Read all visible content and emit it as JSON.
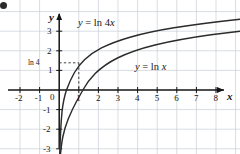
{
  "chart_data": {
    "type": "line",
    "title": "",
    "subtitle": "",
    "xlabel": "x",
    "ylabel": "y",
    "xlim": [
      -2.9,
      9.2
    ],
    "ylim": [
      -3.4,
      3.9
    ],
    "grid": true,
    "grid_color": "#c9cfd6",
    "axis_color": "#1a1a1a",
    "curve_color": "#2b2b2b",
    "background": "#ffffff",
    "legend": "inline-labels",
    "xticks": [
      -2,
      -1,
      0,
      1,
      2,
      3,
      4,
      5,
      6,
      7,
      8
    ],
    "xtick_labels": [
      "-2",
      "-1",
      "0",
      "1",
      "2",
      "3",
      "4",
      "5",
      "6",
      "7",
      "8"
    ],
    "yticks": [
      -3,
      -2,
      -1,
      1,
      2,
      3
    ],
    "ytick_labels": [
      "-3",
      "-2",
      "-1",
      "1",
      "2",
      "3"
    ],
    "annotations": [
      {
        "name": "ln4-y-intercept-label",
        "text": "ln 4",
        "x": -0.55,
        "y": 1.386,
        "note": "value of ln 4x at x = 1"
      }
    ],
    "guide_lines": [
      {
        "name": "horizontal-dashed-ln4",
        "type": "dashed",
        "from": [
          0,
          1.386
        ],
        "to": [
          1,
          1.386
        ]
      },
      {
        "name": "vertical-dashed-x1",
        "type": "dashed",
        "from": [
          1,
          1.386
        ],
        "to": [
          1,
          0
        ]
      }
    ],
    "series": [
      {
        "name": "y = ln 4x",
        "label": "y = ln 4x",
        "label_x": 2.0,
        "label_y": 3.05,
        "equation": "ln(4x)",
        "x": [
          0.02,
          0.05,
          0.1,
          0.15,
          0.2,
          0.25,
          0.3,
          0.4,
          0.5,
          0.6,
          0.8,
          1,
          1.386,
          2,
          2.5,
          3,
          4,
          5,
          6,
          7,
          8,
          9,
          9.2
        ],
        "values": [
          -2.526,
          -1.609,
          -0.916,
          -0.511,
          -0.223,
          0.0,
          0.182,
          0.47,
          0.693,
          0.875,
          1.163,
          1.386,
          1.714,
          2.079,
          2.303,
          2.485,
          2.773,
          2.996,
          3.178,
          3.332,
          3.466,
          3.584,
          3.606
        ]
      },
      {
        "name": "y = ln x",
        "label": "y = ln x",
        "label_x": 4.4,
        "label_y": 1.18,
        "equation": "ln(x)",
        "x": [
          0.06,
          0.1,
          0.2,
          0.3,
          0.4,
          0.5,
          0.7,
          1,
          1.5,
          2,
          3,
          4,
          5,
          6,
          7,
          8,
          9,
          9.2
        ],
        "values": [
          -2.813,
          -2.303,
          -1.609,
          -1.204,
          -0.916,
          -0.693,
          -0.357,
          0.0,
          0.405,
          0.693,
          1.099,
          1.386,
          1.609,
          1.792,
          1.946,
          2.079,
          2.197,
          2.219
        ]
      }
    ]
  },
  "axes": {
    "x_axis_name": "x",
    "y_axis_name": "y"
  },
  "marks": {
    "corner_bullet": "•"
  }
}
